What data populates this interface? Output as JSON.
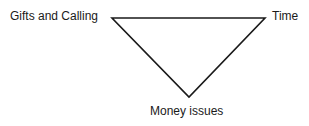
{
  "diagram": {
    "type": "inverted-triangle",
    "vertices": {
      "top_left": {
        "label": "Gifts and Calling"
      },
      "top_right": {
        "label": "Time"
      },
      "bottom": {
        "label": "Money issues"
      }
    },
    "line_color": "#1a1a1a"
  }
}
